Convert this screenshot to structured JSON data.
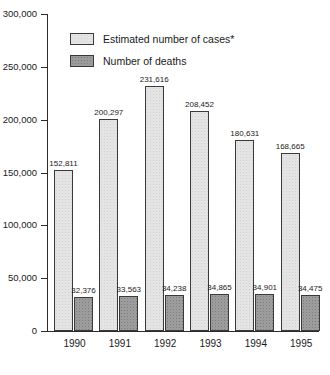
{
  "chart_data": {
    "type": "bar",
    "title": "",
    "subtitle": "",
    "xlabel": "",
    "ylabel": "",
    "categories": [
      "1990",
      "1991",
      "1992",
      "1993",
      "1994",
      "1995"
    ],
    "series": [
      {
        "name": "Estimated number of cases*",
        "key": "cases",
        "values": [
          152811,
          200297,
          231616,
          208452,
          180631,
          168665
        ],
        "labels": [
          "152,811",
          "200,297",
          "231,616",
          "208,452",
          "180,631",
          "168,665"
        ],
        "fill": "#e4e4e4",
        "edge": "#3a3a3a"
      },
      {
        "name": "Number of deaths",
        "key": "deaths",
        "values": [
          32376,
          33563,
          34238,
          34865,
          34901,
          34475
        ],
        "labels": [
          "32,376",
          "33,563",
          "34,238",
          "34,865",
          "34,901",
          "34,475"
        ],
        "fill": "#9c9c9c",
        "edge": "#3a3a3a"
      }
    ],
    "ylim": [
      0,
      300000
    ],
    "yticks": [
      0,
      50000,
      100000,
      150000,
      200000,
      250000,
      300000
    ],
    "ytick_labels": [
      "0",
      "50,000",
      "100,000",
      "150,000",
      "200,000",
      "250,000",
      "300,000"
    ],
    "grid": false,
    "legend_position": "upper-left-inside",
    "axis_color": "#2b2b2b"
  },
  "legend": {
    "items": [
      {
        "label": "Estimated number of cases*"
      },
      {
        "label": "Number of deaths"
      }
    ]
  }
}
